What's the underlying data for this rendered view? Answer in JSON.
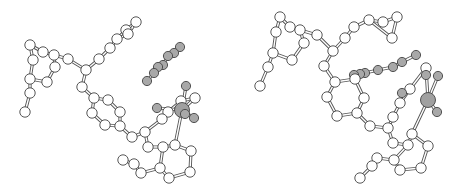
{
  "figure": {
    "colors": {
      "carbon_fill": "#ffffff",
      "hetero_fill": "#a8a8a8",
      "metal_fill": "#a0a0a0",
      "outline": "#444444",
      "bond": "#555555"
    },
    "views": [
      {
        "name": "left-view",
        "atoms": [
          {
            "id": 1,
            "el": "C",
            "x": 30,
            "y": 45
          },
          {
            "id": 2,
            "el": "C",
            "x": 43,
            "y": 52
          },
          {
            "id": 3,
            "el": "C",
            "x": 33,
            "y": 60
          },
          {
            "id": 4,
            "el": "C",
            "x": 54,
            "y": 55
          },
          {
            "id": 5,
            "el": "C",
            "x": 55,
            "y": 67
          },
          {
            "id": 6,
            "el": "C",
            "x": 47,
            "y": 82
          },
          {
            "id": 7,
            "el": "C",
            "x": 30,
            "y": 79
          },
          {
            "id": 8,
            "el": "C",
            "x": 30,
            "y": 93
          },
          {
            "id": 9,
            "el": "C",
            "x": 25,
            "y": 112
          },
          {
            "id": 10,
            "el": "C",
            "x": 68,
            "y": 59
          },
          {
            "id": 11,
            "el": "C",
            "x": 86,
            "y": 70
          },
          {
            "id": 12,
            "el": "C",
            "x": 99,
            "y": 59
          },
          {
            "id": 13,
            "el": "C",
            "x": 110,
            "y": 48
          },
          {
            "id": 14,
            "el": "C",
            "x": 117,
            "y": 39
          },
          {
            "id": 15,
            "el": "C",
            "x": 126,
            "y": 30
          },
          {
            "id": 16,
            "el": "C",
            "x": 136,
            "y": 22
          },
          {
            "id": 17,
            "el": "C",
            "x": 128,
            "y": 34
          },
          {
            "id": 18,
            "el": "C",
            "x": 82,
            "y": 87
          },
          {
            "id": 19,
            "el": "C",
            "x": 94,
            "y": 98
          },
          {
            "id": 20,
            "el": "C",
            "x": 108,
            "y": 100
          },
          {
            "id": 21,
            "el": "C",
            "x": 120,
            "y": 112
          },
          {
            "id": 22,
            "el": "C",
            "x": 120,
            "y": 126
          },
          {
            "id": 23,
            "el": "C",
            "x": 105,
            "y": 125
          },
          {
            "id": 24,
            "el": "C",
            "x": 92,
            "y": 113
          },
          {
            "id": 25,
            "el": "C",
            "x": 132,
            "y": 137
          },
          {
            "id": 26,
            "el": "C",
            "x": 145,
            "y": 132
          },
          {
            "id": 27,
            "el": "C",
            "x": 148,
            "y": 147
          },
          {
            "id": 28,
            "el": "C",
            "x": 163,
            "y": 147
          },
          {
            "id": 29,
            "el": "C",
            "x": 175,
            "y": 145
          },
          {
            "id": 30,
            "el": "C",
            "x": 191,
            "y": 151
          },
          {
            "id": 31,
            "el": "C",
            "x": 190,
            "y": 172
          },
          {
            "id": 32,
            "el": "C",
            "x": 169,
            "y": 178
          },
          {
            "id": 33,
            "el": "C",
            "x": 160,
            "y": 168
          },
          {
            "id": 34,
            "el": "C",
            "x": 141,
            "y": 173
          },
          {
            "id": 35,
            "el": "C",
            "x": 134,
            "y": 164
          },
          {
            "id": 36,
            "el": "C",
            "x": 123,
            "y": 160
          },
          {
            "id": 37,
            "el": "C",
            "x": 162,
            "y": 119
          },
          {
            "id": 38,
            "el": "C",
            "x": 168,
            "y": 112
          },
          {
            "id": 39,
            "el": "C",
            "x": 181,
            "y": 101
          },
          {
            "id": 40,
            "el": "C",
            "x": 195,
            "y": 98
          },
          {
            "id": 41,
            "el": "O",
            "x": 147,
            "y": 81
          },
          {
            "id": 42,
            "el": "O",
            "x": 154,
            "y": 73
          },
          {
            "id": 43,
            "el": "O",
            "x": 158,
            "y": 67
          },
          {
            "id": 44,
            "el": "O",
            "x": 163,
            "y": 65
          },
          {
            "id": 45,
            "el": "O",
            "x": 168,
            "y": 56
          },
          {
            "id": 46,
            "el": "O",
            "x": 174,
            "y": 53
          },
          {
            "id": 47,
            "el": "O",
            "x": 180,
            "y": 47
          },
          {
            "id": 48,
            "el": "M",
            "x": 182,
            "y": 110,
            "r": 7
          },
          {
            "id": 49,
            "el": "O",
            "x": 157,
            "y": 108
          },
          {
            "id": 50,
            "el": "O",
            "x": 186,
            "y": 86
          },
          {
            "id": 51,
            "el": "O",
            "x": 194,
            "y": 118
          },
          {
            "id": 52,
            "el": "O",
            "x": 185,
            "y": 114
          }
        ],
        "bonds": [
          [
            1,
            2
          ],
          [
            1,
            3
          ],
          [
            2,
            4
          ],
          [
            3,
            7
          ],
          [
            4,
            5
          ],
          [
            5,
            6
          ],
          [
            6,
            7
          ],
          [
            4,
            10
          ],
          [
            7,
            8
          ],
          [
            8,
            9
          ],
          [
            10,
            11
          ],
          [
            11,
            12
          ],
          [
            12,
            13
          ],
          [
            13,
            14
          ],
          [
            14,
            15
          ],
          [
            15,
            16
          ],
          [
            14,
            17
          ],
          [
            17,
            16
          ],
          [
            11,
            18
          ],
          [
            18,
            19
          ],
          [
            19,
            20
          ],
          [
            20,
            21
          ],
          [
            21,
            22
          ],
          [
            22,
            23
          ],
          [
            23,
            24
          ],
          [
            24,
            19
          ],
          [
            22,
            25
          ],
          [
            25,
            26
          ],
          [
            26,
            27
          ],
          [
            27,
            28
          ],
          [
            28,
            29
          ],
          [
            29,
            30
          ],
          [
            30,
            31
          ],
          [
            31,
            32
          ],
          [
            32,
            33
          ],
          [
            33,
            28
          ],
          [
            33,
            34
          ],
          [
            34,
            35
          ],
          [
            35,
            36
          ],
          [
            26,
            37
          ],
          [
            37,
            38
          ],
          [
            38,
            39
          ],
          [
            39,
            40
          ],
          [
            48,
            29
          ],
          [
            48,
            49
          ],
          [
            48,
            50
          ],
          [
            48,
            51
          ],
          [
            48,
            40
          ],
          [
            41,
            42
          ],
          [
            42,
            43
          ],
          [
            43,
            44
          ],
          [
            44,
            45
          ],
          [
            45,
            46
          ],
          [
            46,
            47
          ]
        ]
      },
      {
        "name": "right-view",
        "atoms": [
          {
            "id": 1,
            "el": "C",
            "x": 50,
            "y": 17
          },
          {
            "id": 2,
            "el": "C",
            "x": 60,
            "y": 27
          },
          {
            "id": 3,
            "el": "C",
            "x": 46,
            "y": 32
          },
          {
            "id": 4,
            "el": "C",
            "x": 70,
            "y": 30
          },
          {
            "id": 5,
            "el": "C",
            "x": 74,
            "y": 43
          },
          {
            "id": 6,
            "el": "C",
            "x": 62,
            "y": 60
          },
          {
            "id": 7,
            "el": "C",
            "x": 43,
            "y": 53
          },
          {
            "id": 8,
            "el": "C",
            "x": 38,
            "y": 67
          },
          {
            "id": 9,
            "el": "C",
            "x": 30,
            "y": 86
          },
          {
            "id": 10,
            "el": "C",
            "x": 87,
            "y": 35
          },
          {
            "id": 11,
            "el": "C",
            "x": 103,
            "y": 51
          },
          {
            "id": 12,
            "el": "C",
            "x": 115,
            "y": 38
          },
          {
            "id": 13,
            "el": "C",
            "x": 124,
            "y": 27
          },
          {
            "id": 14,
            "el": "C",
            "x": 139,
            "y": 20
          },
          {
            "id": 15,
            "el": "C",
            "x": 153,
            "y": 22
          },
          {
            "id": 16,
            "el": "C",
            "x": 167,
            "y": 17
          },
          {
            "id": 17,
            "el": "C",
            "x": 162,
            "y": 38
          },
          {
            "id": 18,
            "el": "C",
            "x": 94,
            "y": 66
          },
          {
            "id": 19,
            "el": "C",
            "x": 105,
            "y": 82
          },
          {
            "id": 20,
            "el": "C",
            "x": 125,
            "y": 79
          },
          {
            "id": 21,
            "el": "C",
            "x": 134,
            "y": 98
          },
          {
            "id": 22,
            "el": "C",
            "x": 127,
            "y": 113
          },
          {
            "id": 23,
            "el": "C",
            "x": 107,
            "y": 116
          },
          {
            "id": 24,
            "el": "C",
            "x": 97,
            "y": 97
          },
          {
            "id": 25,
            "el": "C",
            "x": 140,
            "y": 126
          },
          {
            "id": 26,
            "el": "C",
            "x": 158,
            "y": 128
          },
          {
            "id": 27,
            "el": "C",
            "x": 163,
            "y": 143
          },
          {
            "id": 28,
            "el": "C",
            "x": 178,
            "y": 145
          },
          {
            "id": 29,
            "el": "C",
            "x": 182,
            "y": 134
          },
          {
            "id": 30,
            "el": "C",
            "x": 198,
            "y": 146
          },
          {
            "id": 31,
            "el": "C",
            "x": 191,
            "y": 168
          },
          {
            "id": 32,
            "el": "C",
            "x": 170,
            "y": 170
          },
          {
            "id": 33,
            "el": "C",
            "x": 164,
            "y": 160
          },
          {
            "id": 34,
            "el": "C",
            "x": 147,
            "y": 158
          },
          {
            "id": 35,
            "el": "C",
            "x": 142,
            "y": 166
          },
          {
            "id": 36,
            "el": "C",
            "x": 130,
            "y": 178
          },
          {
            "id": 37,
            "el": "C",
            "x": 163,
            "y": 117
          },
          {
            "id": 38,
            "el": "C",
            "x": 170,
            "y": 103
          },
          {
            "id": 39,
            "el": "C",
            "x": 180,
            "y": 89
          },
          {
            "id": 40,
            "el": "C",
            "x": 196,
            "y": 68
          },
          {
            "id": 41,
            "el": "O",
            "x": 124,
            "y": 75
          },
          {
            "id": 42,
            "el": "O",
            "x": 135,
            "y": 73
          },
          {
            "id": 43,
            "el": "O",
            "x": 148,
            "y": 70
          },
          {
            "id": 44,
            "el": "O",
            "x": 163,
            "y": 67
          },
          {
            "id": 45,
            "el": "O",
            "x": 172,
            "y": 62
          },
          {
            "id": 46,
            "el": "O",
            "x": 186,
            "y": 55
          },
          {
            "id": 47,
            "el": "O",
            "x": 130,
            "y": 74
          },
          {
            "id": 48,
            "el": "M",
            "x": 198,
            "y": 100,
            "r": 7
          },
          {
            "id": 49,
            "el": "O",
            "x": 172,
            "y": 93
          },
          {
            "id": 50,
            "el": "O",
            "x": 208,
            "y": 76
          },
          {
            "id": 51,
            "el": "O",
            "x": 207,
            "y": 112
          },
          {
            "id": 52,
            "el": "O",
            "x": 196,
            "y": 75
          }
        ],
        "bonds": [
          [
            1,
            2
          ],
          [
            1,
            3
          ],
          [
            2,
            4
          ],
          [
            3,
            7
          ],
          [
            4,
            5
          ],
          [
            5,
            6
          ],
          [
            6,
            7
          ],
          [
            4,
            10
          ],
          [
            7,
            8
          ],
          [
            8,
            9
          ],
          [
            10,
            11
          ],
          [
            11,
            12
          ],
          [
            12,
            13
          ],
          [
            13,
            14
          ],
          [
            14,
            15
          ],
          [
            15,
            16
          ],
          [
            14,
            17
          ],
          [
            17,
            16
          ],
          [
            11,
            18
          ],
          [
            18,
            19
          ],
          [
            19,
            20
          ],
          [
            20,
            21
          ],
          [
            21,
            22
          ],
          [
            22,
            23
          ],
          [
            23,
            24
          ],
          [
            24,
            19
          ],
          [
            22,
            25
          ],
          [
            25,
            26
          ],
          [
            26,
            27
          ],
          [
            27,
            28
          ],
          [
            28,
            29
          ],
          [
            29,
            30
          ],
          [
            30,
            31
          ],
          [
            31,
            32
          ],
          [
            32,
            33
          ],
          [
            33,
            28
          ],
          [
            33,
            34
          ],
          [
            34,
            35
          ],
          [
            35,
            36
          ],
          [
            26,
            37
          ],
          [
            37,
            38
          ],
          [
            38,
            39
          ],
          [
            39,
            40
          ],
          [
            48,
            29
          ],
          [
            48,
            50
          ],
          [
            48,
            51
          ],
          [
            48,
            40
          ],
          [
            41,
            47
          ],
          [
            47,
            42
          ],
          [
            42,
            43
          ],
          [
            43,
            44
          ],
          [
            44,
            45
          ],
          [
            45,
            46
          ]
        ]
      }
    ]
  }
}
